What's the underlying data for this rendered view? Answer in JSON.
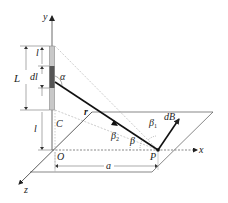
{
  "diagram": {
    "axes": {
      "x": "x",
      "y": "y",
      "z": "z"
    },
    "points": {
      "origin": "O",
      "foot": "C",
      "field_point": "P"
    },
    "segment_labels": {
      "upper_length": "l",
      "element": "dl",
      "total_length": "L",
      "lower_length": "l",
      "distance": "a"
    },
    "vectors": {
      "position": "r",
      "field_d": "d",
      "field_B": "B"
    },
    "angles": {
      "alpha": "α",
      "beta": "β",
      "beta1_base": "β",
      "beta1_sub": "1",
      "beta2_base": "β",
      "beta2_sub": "2"
    },
    "colors": {
      "line": "#222222",
      "dashed": "#888888",
      "wire_fill": "#bdbdbd",
      "element_fill": "#555555"
    }
  }
}
